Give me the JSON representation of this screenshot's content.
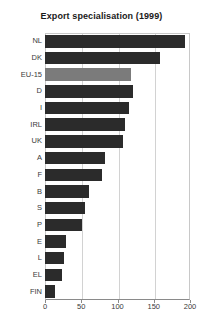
{
  "chart_data": {
    "type": "bar",
    "orientation": "horizontal",
    "title": "Export specialisation (1999)",
    "xlabel": "",
    "ylabel": "",
    "xlim": [
      0,
      200
    ],
    "xticks": [
      0,
      50,
      100,
      150,
      200
    ],
    "grid": true,
    "legend": "none",
    "categories": [
      "NL",
      "DK",
      "EU-15",
      "D",
      "I",
      "IRL",
      "UK",
      "A",
      "F",
      "B",
      "S",
      "P",
      "E",
      "L",
      "EL",
      "FIN"
    ],
    "values": [
      193,
      158,
      119,
      121,
      116,
      110,
      108,
      83,
      79,
      61,
      55,
      51,
      29,
      26,
      23,
      14
    ],
    "highlight_category": "EU-15",
    "colors": {
      "bar": "#2b2b2b",
      "bar_highlight": "#7b7b7b",
      "grid": "#d2d2d2",
      "axis": "#8a8a8a",
      "text": "#3a3a3a",
      "title": "#1a1a1a",
      "background": "#ffffff"
    }
  }
}
